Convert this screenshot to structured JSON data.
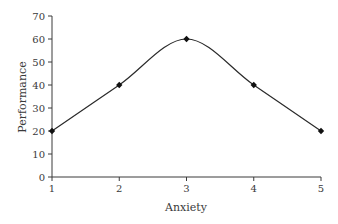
{
  "chart_data": {
    "type": "line",
    "title": "",
    "xlabel": "Anxiety",
    "ylabel": "Performance",
    "x": [
      1,
      2,
      3,
      4,
      5
    ],
    "categories": [
      "1",
      "2",
      "3",
      "4",
      "5"
    ],
    "series": [
      {
        "name": "Performance",
        "values": [
          20,
          40,
          60,
          40,
          20
        ],
        "color": "#2a2a2a",
        "marker": "diamond",
        "smooth": true
      }
    ],
    "xlim": [
      1,
      5
    ],
    "ylim": [
      0,
      70
    ],
    "xticks": [
      "1",
      "2",
      "3",
      "4",
      "5"
    ],
    "yticks": [
      "0",
      "10",
      "20",
      "30",
      "40",
      "50",
      "60",
      "70"
    ],
    "grid": false,
    "legend": null
  }
}
